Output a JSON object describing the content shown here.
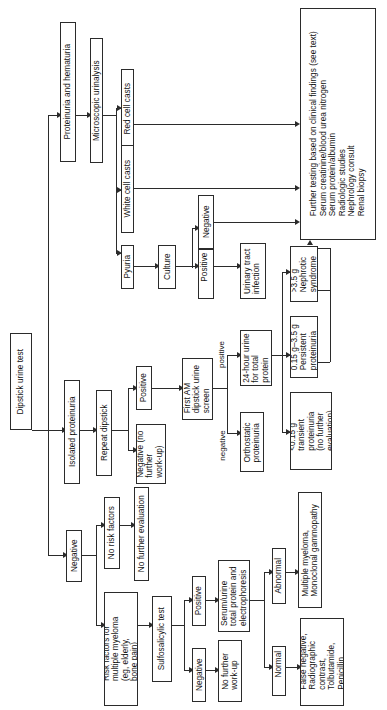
{
  "diagram": {
    "orientation": "rotated-90-ccw",
    "nodes": {
      "root": "Dipstick urine test",
      "proteinuria_hematuria": "Proteinuria and hematuria",
      "microscopic_urinalysis": "Microscopic urinalysis",
      "red_cell_casts": "Red cell casts",
      "white_cell_casts": "White cell casts",
      "pyuria": "Pyuria",
      "culture": "Culture",
      "culture_negative": "Negative",
      "culture_positive": "Positive",
      "uti": "Urinary tract\ninfection",
      "further_testing": "Further testing based on clinical findings (see text)\nSerum creatinine/blood urea nitrogen\nSerum protein/albumin\nRadiologic studies\nNephrology consult\nRenal biopsy",
      "isolated_proteinuria": "Isolated proteinuria",
      "repeat_dipstick": "Repeat dipstick",
      "repeat_negative": "Negative (no\nfurther\nwork-up)",
      "repeat_positive": "Positive",
      "first_am_screen": "First AM\ndipstick urine\nscreen",
      "orthostatic": "Orthostatic\nproteinuria",
      "24h_urine": "24-hour urine\nfor total\nprotein",
      "nephrotic": ">3.5 g\nNephrotic\nsyndrome",
      "persistent": "0.15 g–3.5 g\nPersistent\nproteinuria",
      "transient": "<0.15 g\ntransient\nproteinuria\n(no further\nevaluation)",
      "negative": "Negative",
      "no_risk_factors": "No risk factors",
      "no_further_evaluation": "No further evaluation",
      "risk_factors": "Risk factors for\nmultiple myeloma\n(eg, elderly,\nbone pain)",
      "sulfosalicylic": "Sulfosalicylic test",
      "ssa_negative": "Negative",
      "ssa_positive": "Positive",
      "no_further_workup": "No further\nwork-up",
      "serum_urine": "Serum/urine\ntotal protein and\nelectrophoresis",
      "abnormal": "Abnormal",
      "normal": "Normal",
      "myeloma_result": "Multiple myeloma,\nMonoclonal gammopathy",
      "false_negative_result": "False negative,\nRadiographic\ncontrast,\nTolbutamide,\nPenicillin"
    },
    "edge_labels": {
      "first_am_negative": "negative",
      "first_am_positive": "positive"
    },
    "colors": {
      "line": "#2b2b2b",
      "text": "#111111",
      "background": "#ffffff"
    }
  }
}
